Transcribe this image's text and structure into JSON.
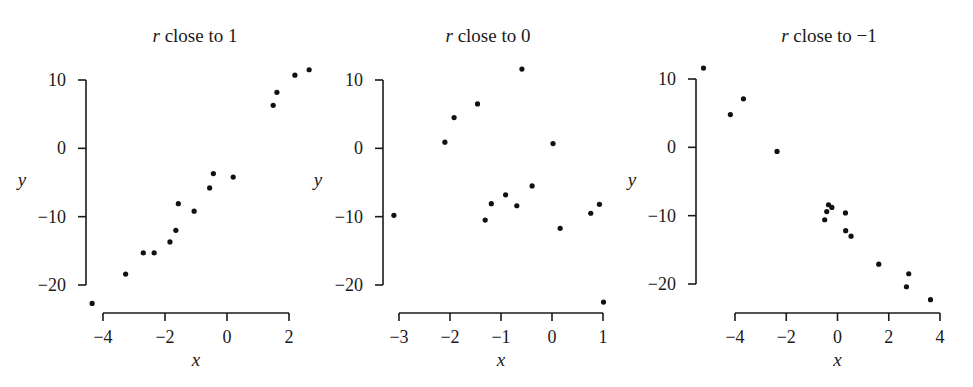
{
  "chart_data": [
    {
      "type": "scatter",
      "title": "r close to 1",
      "title_italic_prefix": "r",
      "title_rest": " close to 1",
      "xlabel": "x",
      "ylabel": "y",
      "xticks": [
        -4,
        -2,
        0,
        2
      ],
      "xtick_labels": [
        "−4",
        "−2",
        "0",
        "2"
      ],
      "yticks": [
        10,
        0,
        -10,
        -20
      ],
      "ytick_labels": [
        "10",
        "0",
        "−10",
        "−20"
      ],
      "xlim": [
        -4,
        2
      ],
      "ylim": [
        -20,
        10
      ],
      "grid": false,
      "points": [
        {
          "x": -4.35,
          "y": -22.7
        },
        {
          "x": -3.27,
          "y": -18.4
        },
        {
          "x": -2.7,
          "y": -15.3
        },
        {
          "x": -2.35,
          "y": -15.3
        },
        {
          "x": -1.84,
          "y": -13.7
        },
        {
          "x": -1.65,
          "y": -12.0
        },
        {
          "x": -1.57,
          "y": -8.1
        },
        {
          "x": -1.06,
          "y": -9.2
        },
        {
          "x": -0.56,
          "y": -5.8
        },
        {
          "x": -0.44,
          "y": -3.7
        },
        {
          "x": 0.2,
          "y": -4.2
        },
        {
          "x": 1.49,
          "y": 6.3
        },
        {
          "x": 1.61,
          "y": 8.2
        },
        {
          "x": 2.19,
          "y": 10.7
        },
        {
          "x": 2.65,
          "y": 11.5
        }
      ]
    },
    {
      "type": "scatter",
      "title": "r close to 0",
      "title_italic_prefix": "r",
      "title_rest": " close to 0",
      "xlabel": "x",
      "ylabel": "y",
      "xticks": [
        -3,
        -2,
        -1,
        0,
        1
      ],
      "xtick_labels": [
        "−3",
        "−2",
        "−1",
        "0",
        "1"
      ],
      "yticks": [
        10,
        0,
        -10,
        -20
      ],
      "ytick_labels": [
        "10",
        "0",
        "−10",
        "−20"
      ],
      "xlim": [
        -3,
        1
      ],
      "ylim": [
        -20,
        10
      ],
      "grid": false,
      "points": [
        {
          "x": -3.1,
          "y": -9.8
        },
        {
          "x": -2.1,
          "y": 0.9
        },
        {
          "x": -1.92,
          "y": 4.5
        },
        {
          "x": -1.46,
          "y": 6.5
        },
        {
          "x": -0.59,
          "y": 11.6
        },
        {
          "x": 0.02,
          "y": 0.7
        },
        {
          "x": -0.39,
          "y": -5.5
        },
        {
          "x": -0.91,
          "y": -6.8
        },
        {
          "x": -1.19,
          "y": -8.1
        },
        {
          "x": -0.69,
          "y": -8.4
        },
        {
          "x": -1.31,
          "y": -10.5
        },
        {
          "x": 0.16,
          "y": -11.7
        },
        {
          "x": 0.76,
          "y": -9.5
        },
        {
          "x": 0.93,
          "y": -8.2
        },
        {
          "x": 1.01,
          "y": -22.5
        }
      ]
    },
    {
      "type": "scatter",
      "title": "r close to −1",
      "title_italic_prefix": "r",
      "title_rest": " close to −1",
      "xlabel": "x",
      "ylabel": "y",
      "xticks": [
        -4,
        -2,
        0,
        2,
        4
      ],
      "xtick_labels": [
        "−4",
        "−2",
        "0",
        "2",
        "4"
      ],
      "yticks": [
        10,
        0,
        -10,
        -20
      ],
      "ytick_labels": [
        "10",
        "0",
        "−10",
        "−20"
      ],
      "xlim": [
        -4,
        4
      ],
      "ylim": [
        -20,
        10
      ],
      "grid": false,
      "points": [
        {
          "x": -5.23,
          "y": 11.6
        },
        {
          "x": -3.67,
          "y": 7.1
        },
        {
          "x": -4.18,
          "y": 4.8
        },
        {
          "x": -2.36,
          "y": -0.6
        },
        {
          "x": -0.35,
          "y": -8.4
        },
        {
          "x": -0.22,
          "y": -8.8
        },
        {
          "x": -0.42,
          "y": -9.4
        },
        {
          "x": -0.5,
          "y": -10.6
        },
        {
          "x": 0.31,
          "y": -9.6
        },
        {
          "x": 0.32,
          "y": -12.2
        },
        {
          "x": 0.53,
          "y": -13.0
        },
        {
          "x": 1.61,
          "y": -17.1
        },
        {
          "x": 2.78,
          "y": -18.5
        },
        {
          "x": 2.69,
          "y": -20.4
        },
        {
          "x": 3.63,
          "y": -22.3
        }
      ]
    }
  ]
}
